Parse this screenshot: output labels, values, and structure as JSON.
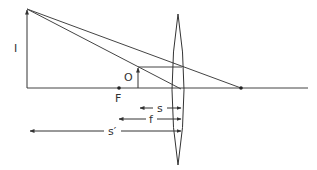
{
  "diagram": {
    "labels": {
      "image": "I",
      "object": "O",
      "focal_point": "F",
      "object_distance": "s",
      "focal_length": "f",
      "image_distance": "s′"
    },
    "colors": {
      "line": "#333333",
      "background": "#ffffff"
    }
  }
}
